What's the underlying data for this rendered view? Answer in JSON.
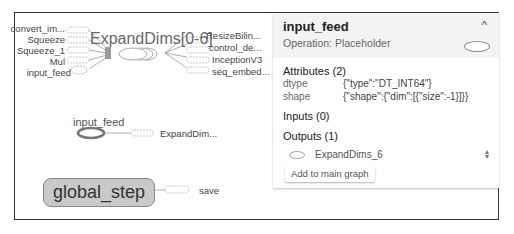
{
  "graph": {
    "group_node": {
      "label": "ExpandDims[0-6]"
    },
    "inputs": [
      "convert_im...",
      "Squeeze",
      "Squeeze_1",
      "Mul",
      "input_feed"
    ],
    "outputs": [
      "ResizeBilin...",
      "control_de...",
      "InceptionV3",
      "seq_embed..."
    ],
    "input_feed_node": {
      "label": "input_feed",
      "output": "ExpandDim..."
    },
    "global_step_node": {
      "label": "global_step",
      "output": "save"
    }
  },
  "panel": {
    "title": "input_feed",
    "subtitle": "Operation: Placeholder",
    "collapse_icon": "^",
    "attributes_header": "Attributes (2)",
    "attributes": [
      {
        "key": "dtype",
        "value": "{\"type\":\"DT_INT64\"}"
      },
      {
        "key": "shape",
        "value": "{\"shape\":{\"dim\":[{\"size\":-1}]}}"
      }
    ],
    "inputs_header": "Inputs (0)",
    "outputs_header": "Outputs (1)",
    "outputs": [
      {
        "name": "ExpandDims_6"
      }
    ],
    "add_button": "Add to main graph"
  }
}
